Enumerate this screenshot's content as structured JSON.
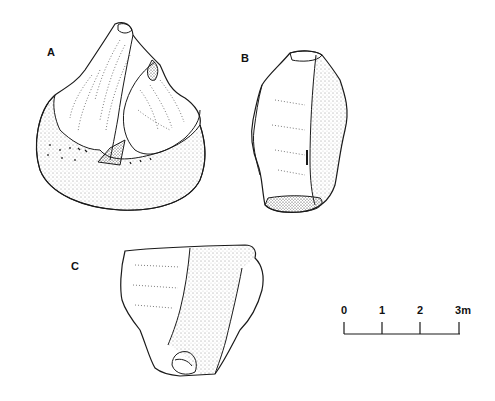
{
  "figure": {
    "artifacts": [
      {
        "id": "A",
        "label": "A"
      },
      {
        "id": "B",
        "label": "B"
      },
      {
        "id": "C",
        "label": "C"
      }
    ],
    "scale_bar": {
      "ticks": [
        "0",
        "1",
        "2",
        "3m"
      ],
      "unit": "m"
    },
    "colors": {
      "ink": "#1a1a1a",
      "background": "#ffffff"
    }
  }
}
